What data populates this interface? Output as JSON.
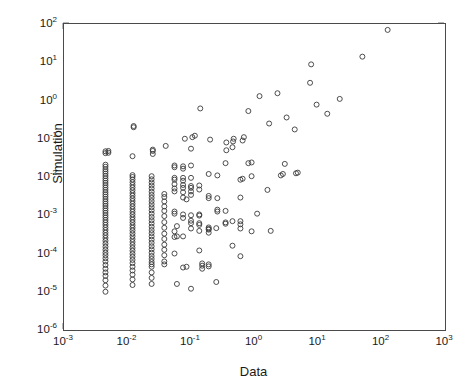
{
  "chart_data": {
    "type": "scatter",
    "title": "",
    "xlabel": "Data",
    "ylabel": "Simulation",
    "xscale": "log",
    "yscale": "log",
    "xlim": [
      0.001,
      1000
    ],
    "ylim": [
      1e-06,
      100
    ],
    "grid": false,
    "legend": null,
    "marker": "open-circle",
    "marker_color": "#3a3a3a",
    "marker_size_px": 5,
    "xticks": [
      0.001,
      0.01,
      0.1,
      1,
      10,
      100,
      1000
    ],
    "xtick_labels": [
      "10-3",
      "10-2",
      "10-1",
      "100",
      "101",
      "102",
      "103"
    ],
    "xtick_mantissa": [
      "10",
      "10",
      "10",
      "10",
      "10",
      "10",
      "10"
    ],
    "xtick_exponents": [
      "-3",
      "-2",
      "-1",
      "0",
      "1",
      "2",
      "3"
    ],
    "yticks": [
      1e-06,
      1e-05,
      0.0001,
      0.001,
      0.01,
      0.1,
      1,
      10,
      100
    ],
    "ytick_mantissa": [
      "10",
      "10",
      "10",
      "10",
      "10",
      "10",
      "10",
      "10",
      "10"
    ],
    "ytick_exponents": [
      "-6",
      "-5",
      "-4",
      "-3",
      "-2",
      "-1",
      "0",
      "1",
      "2"
    ],
    "points": [
      [
        0.0045,
        1e-05
      ],
      [
        0.0045,
        1.45e-05
      ],
      [
        0.0045,
        2e-05
      ],
      [
        0.0045,
        2.6e-05
      ],
      [
        0.0045,
        3.2e-05
      ],
      [
        0.0045,
        4e-05
      ],
      [
        0.0045,
        5e-05
      ],
      [
        0.0045,
        6.2e-05
      ],
      [
        0.0045,
        7.5e-05
      ],
      [
        0.0045,
        9e-05
      ],
      [
        0.0045,
        0.000105
      ],
      [
        0.0045,
        0.000125
      ],
      [
        0.0045,
        0.00015
      ],
      [
        0.0045,
        0.00018
      ],
      [
        0.0045,
        0.000215
      ],
      [
        0.0045,
        0.000255
      ],
      [
        0.0045,
        0.0003
      ],
      [
        0.0045,
        0.00035
      ],
      [
        0.0045,
        0.00041
      ],
      [
        0.0045,
        0.00048
      ],
      [
        0.0045,
        0.00056
      ],
      [
        0.0045,
        0.00065
      ],
      [
        0.0045,
        0.00075
      ],
      [
        0.0045,
        0.00087
      ],
      [
        0.0045,
        0.001
      ],
      [
        0.0045,
        0.00115
      ],
      [
        0.0045,
        0.00132
      ],
      [
        0.0045,
        0.00152
      ],
      [
        0.0045,
        0.00175
      ],
      [
        0.0045,
        0.002
      ],
      [
        0.0045,
        0.0023
      ],
      [
        0.0045,
        0.00265
      ],
      [
        0.0045,
        0.00305
      ],
      [
        0.0045,
        0.0035
      ],
      [
        0.0045,
        0.004
      ],
      [
        0.0045,
        0.0046
      ],
      [
        0.0045,
        0.0053
      ],
      [
        0.0045,
        0.0061
      ],
      [
        0.0045,
        0.007
      ],
      [
        0.0045,
        0.008
      ],
      [
        0.0045,
        0.0092
      ],
      [
        0.0045,
        0.0106
      ],
      [
        0.0045,
        0.0122
      ],
      [
        0.0045,
        0.014
      ],
      [
        0.0045,
        0.016
      ],
      [
        0.0045,
        0.0185
      ],
      [
        0.0045,
        0.021
      ],
      [
        0.0045,
        0.042
      ],
      [
        0.0045,
        0.047
      ],
      [
        0.005,
        0.043
      ],
      [
        0.005,
        0.048
      ],
      [
        0.012,
        1.5e-05
      ],
      [
        0.012,
        2.1e-05
      ],
      [
        0.012,
        2.8e-05
      ],
      [
        0.012,
        3.6e-05
      ],
      [
        0.012,
        4.5e-05
      ],
      [
        0.012,
        5.6e-05
      ],
      [
        0.012,
        6.8e-05
      ],
      [
        0.012,
        8.2e-05
      ],
      [
        0.012,
        9.8e-05
      ],
      [
        0.012,
        0.000118
      ],
      [
        0.012,
        0.00014
      ],
      [
        0.012,
        0.000168
      ],
      [
        0.012,
        0.0002
      ],
      [
        0.012,
        0.000238
      ],
      [
        0.012,
        0.000282
      ],
      [
        0.012,
        0.000335
      ],
      [
        0.012,
        0.0004
      ],
      [
        0.012,
        0.00047
      ],
      [
        0.012,
        0.00055
      ],
      [
        0.012,
        0.00065
      ],
      [
        0.012,
        0.00076
      ],
      [
        0.012,
        0.00089
      ],
      [
        0.012,
        0.00105
      ],
      [
        0.012,
        0.00123
      ],
      [
        0.012,
        0.00145
      ],
      [
        0.012,
        0.0017
      ],
      [
        0.012,
        0.002
      ],
      [
        0.012,
        0.00235
      ],
      [
        0.012,
        0.00275
      ],
      [
        0.012,
        0.00325
      ],
      [
        0.012,
        0.0038
      ],
      [
        0.012,
        0.0045
      ],
      [
        0.012,
        0.0053
      ],
      [
        0.012,
        0.0062
      ],
      [
        0.012,
        0.0073
      ],
      [
        0.012,
        0.0086
      ],
      [
        0.012,
        0.01
      ],
      [
        0.012,
        0.0112
      ],
      [
        0.012,
        0.035
      ],
      [
        0.0125,
        0.2
      ],
      [
        0.0125,
        0.215
      ],
      [
        0.024,
        1.6e-05
      ],
      [
        0.024,
        2.3e-05
      ],
      [
        0.024,
        3.2e-05
      ],
      [
        0.024,
        4.5e-05
      ],
      [
        0.024,
        5.2e-05
      ],
      [
        0.024,
        6e-05
      ],
      [
        0.024,
        7.2e-05
      ],
      [
        0.024,
        8.6e-05
      ],
      [
        0.024,
        0.000105
      ],
      [
        0.024,
        0.000128
      ],
      [
        0.024,
        0.000155
      ],
      [
        0.024,
        0.00019
      ],
      [
        0.024,
        0.00023
      ],
      [
        0.024,
        0.00028
      ],
      [
        0.024,
        0.00034
      ],
      [
        0.024,
        0.00041
      ],
      [
        0.024,
        0.0005
      ],
      [
        0.024,
        0.00061
      ],
      [
        0.024,
        0.00074
      ],
      [
        0.024,
        0.0009
      ],
      [
        0.024,
        0.0011
      ],
      [
        0.024,
        0.00134
      ],
      [
        0.024,
        0.00162
      ],
      [
        0.024,
        0.00195
      ],
      [
        0.024,
        0.00235
      ],
      [
        0.024,
        0.00285
      ],
      [
        0.024,
        0.0034
      ],
      [
        0.024,
        0.0041
      ],
      [
        0.024,
        0.005
      ],
      [
        0.024,
        0.006
      ],
      [
        0.024,
        0.0072
      ],
      [
        0.024,
        0.0087
      ],
      [
        0.024,
        0.0105
      ],
      [
        0.025,
        0.04
      ],
      [
        0.025,
        0.048
      ],
      [
        0.025,
        0.052
      ],
      [
        0.038,
        5.2e-05
      ],
      [
        0.038,
        6.2e-05
      ],
      [
        0.038,
        9e-05
      ],
      [
        0.038,
        0.000125
      ],
      [
        0.038,
        0.00017
      ],
      [
        0.038,
        0.00024
      ],
      [
        0.038,
        0.00033
      ],
      [
        0.038,
        0.00047
      ],
      [
        0.038,
        0.00066
      ],
      [
        0.038,
        0.00095
      ],
      [
        0.038,
        0.0013
      ],
      [
        0.038,
        0.0017
      ],
      [
        0.038,
        0.0023
      ],
      [
        0.038,
        0.003
      ],
      [
        0.038,
        0.0036
      ],
      [
        0.04,
        0.065
      ],
      [
        0.055,
        0.0001
      ],
      [
        0.055,
        0.00027
      ],
      [
        0.055,
        0.00038
      ],
      [
        0.055,
        0.0011
      ],
      [
        0.055,
        0.00125
      ],
      [
        0.055,
        0.0042
      ],
      [
        0.055,
        0.005
      ],
      [
        0.055,
        0.0065
      ],
      [
        0.055,
        0.0085
      ],
      [
        0.055,
        0.0095
      ],
      [
        0.055,
        0.018
      ],
      [
        0.055,
        0.02
      ],
      [
        0.06,
        1.6e-05
      ],
      [
        0.06,
        0.00028
      ],
      [
        0.06,
        0.00052
      ],
      [
        0.075,
        4.3e-05
      ],
      [
        0.075,
        0.00028
      ],
      [
        0.075,
        0.00085
      ],
      [
        0.075,
        0.00105
      ],
      [
        0.075,
        0.0029
      ],
      [
        0.075,
        0.004
      ],
      [
        0.075,
        0.0052
      ],
      [
        0.075,
        0.0062
      ],
      [
        0.075,
        0.008
      ],
      [
        0.075,
        0.0095
      ],
      [
        0.075,
        0.0165
      ],
      [
        0.075,
        0.019
      ],
      [
        0.08,
        0.1
      ],
      [
        0.085,
        4.5e-05
      ],
      [
        0.085,
        0.0026
      ],
      [
        0.1,
        1.2e-05
      ],
      [
        0.1,
        0.00045
      ],
      [
        0.1,
        0.00062
      ],
      [
        0.1,
        0.00072
      ],
      [
        0.1,
        0.001
      ],
      [
        0.1,
        0.0034
      ],
      [
        0.1,
        0.0042
      ],
      [
        0.1,
        0.0052
      ],
      [
        0.1,
        0.0058
      ],
      [
        0.1,
        0.0095
      ],
      [
        0.1,
        0.02
      ],
      [
        0.1,
        0.055
      ],
      [
        0.105,
        0.11
      ],
      [
        0.115,
        0.12
      ],
      [
        0.135,
        0.00012
      ],
      [
        0.135,
        0.00039
      ],
      [
        0.135,
        0.00056
      ],
      [
        0.135,
        0.00062
      ],
      [
        0.135,
        0.00098
      ],
      [
        0.135,
        0.00105
      ],
      [
        0.135,
        0.0047
      ],
      [
        0.135,
        0.006
      ],
      [
        0.14,
        0.62
      ],
      [
        0.15,
        4e-05
      ],
      [
        0.15,
        4.8e-05
      ],
      [
        0.15,
        5.5e-05
      ],
      [
        0.19,
        4.6e-05
      ],
      [
        0.19,
        5.2e-05
      ],
      [
        0.19,
        0.00035
      ],
      [
        0.19,
        0.00042
      ],
      [
        0.19,
        0.00044
      ],
      [
        0.19,
        0.00048
      ],
      [
        0.19,
        0.0028
      ],
      [
        0.19,
        0.0032
      ],
      [
        0.19,
        0.012
      ],
      [
        0.2,
        0.095
      ],
      [
        0.25,
        1.8e-05
      ],
      [
        0.25,
        0.00046
      ],
      [
        0.26,
        0.00125
      ],
      [
        0.26,
        0.0014
      ],
      [
        0.26,
        0.0028
      ],
      [
        0.26,
        0.011
      ],
      [
        0.35,
        0.0006
      ],
      [
        0.35,
        0.00065
      ],
      [
        0.35,
        0.0013
      ],
      [
        0.35,
        0.023
      ],
      [
        0.36,
        0.05
      ],
      [
        0.36,
        0.08
      ],
      [
        0.45,
        0.00016
      ],
      [
        0.45,
        0.0007
      ],
      [
        0.45,
        0.06
      ],
      [
        0.46,
        0.085
      ],
      [
        0.47,
        0.1
      ],
      [
        0.6,
        8.5e-05
      ],
      [
        0.6,
        0.00045
      ],
      [
        0.6,
        0.00058
      ],
      [
        0.6,
        0.0007
      ],
      [
        0.6,
        0.0029
      ],
      [
        0.6,
        0.0085
      ],
      [
        0.65,
        0.009
      ],
      [
        0.65,
        0.09
      ],
      [
        0.68,
        0.11
      ],
      [
        0.8,
        0.023
      ],
      [
        0.8,
        0.53
      ],
      [
        0.9,
        0.00038
      ],
      [
        0.9,
        0.0105
      ],
      [
        0.9,
        0.024
      ],
      [
        1.1,
        0.0011
      ],
      [
        1.2,
        1.3
      ],
      [
        1.6,
        0.0046
      ],
      [
        1.7,
        0.25
      ],
      [
        1.8,
        0.00039
      ],
      [
        2.3,
        1.55
      ],
      [
        2.6,
        0.011
      ],
      [
        2.8,
        0.012
      ],
      [
        3.0,
        0.022
      ],
      [
        3.2,
        0.36
      ],
      [
        4.3,
        0.175
      ],
      [
        4.5,
        0.0125
      ],
      [
        4.8,
        0.013
      ],
      [
        7.5,
        2.9
      ],
      [
        7.8,
        8.8
      ],
      [
        9.5,
        0.78
      ],
      [
        14.0,
        0.45
      ],
      [
        22.0,
        1.1
      ],
      [
        50.0,
        14.0
      ],
      [
        125.0,
        70.0
      ]
    ]
  }
}
